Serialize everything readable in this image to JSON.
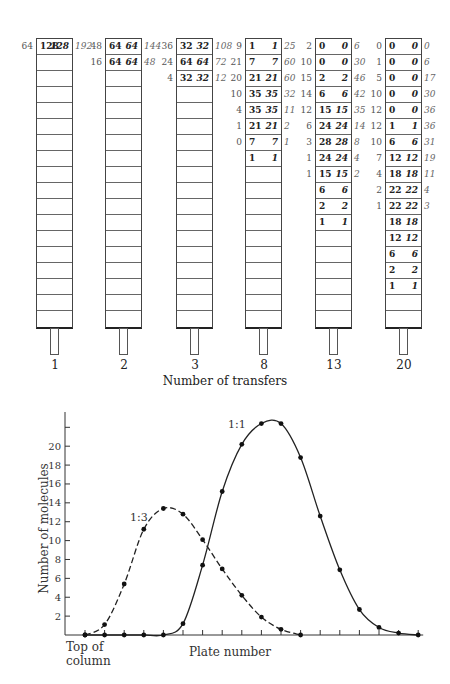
{
  "countercurrent": {
    "xlabel": "Number of transfers",
    "columns": [
      {
        "label": "1",
        "x": 36,
        "rows": [
          {
            "left": "64",
            "a": "128",
            "b": "128",
            "right": "192"
          }
        ]
      },
      {
        "label": "2",
        "x": 105,
        "rows": [
          {
            "left": "48",
            "a": "64",
            "b": "64",
            "right": "144"
          },
          {
            "left": "16",
            "a": "64",
            "b": "64",
            "right": "48"
          }
        ]
      },
      {
        "label": "3",
        "x": 176,
        "rows": [
          {
            "left": "36",
            "a": "32",
            "b": "32",
            "right": "108"
          },
          {
            "left": "24",
            "a": "64",
            "b": "64",
            "right": "72"
          },
          {
            "left": "4",
            "a": "32",
            "b": "32",
            "right": "12"
          }
        ]
      },
      {
        "label": "8",
        "x": 245,
        "rows": [
          {
            "left": "9",
            "a": "1",
            "b": "1",
            "right": "25"
          },
          {
            "left": "21",
            "a": "7",
            "b": "7",
            "right": "60"
          },
          {
            "left": "20",
            "a": "21",
            "b": "21",
            "right": "60"
          },
          {
            "left": "10",
            "a": "35",
            "b": "35",
            "right": "32"
          },
          {
            "left": "4",
            "a": "35",
            "b": "35",
            "right": "11"
          },
          {
            "left": "1",
            "a": "21",
            "b": "21",
            "right": "2"
          },
          {
            "left": "0",
            "a": "7",
            "b": "7",
            "right": "1"
          },
          {
            "left": "",
            "a": "1",
            "b": "1",
            "right": ""
          }
        ]
      },
      {
        "label": "13",
        "x": 315,
        "rows": [
          {
            "left": "2",
            "a": "0",
            "b": "0",
            "right": "6"
          },
          {
            "left": "10",
            "a": "0",
            "b": "0",
            "right": "30"
          },
          {
            "left": "15",
            "a": "2",
            "b": "2",
            "right": "46"
          },
          {
            "left": "14",
            "a": "6",
            "b": "6",
            "right": "42"
          },
          {
            "left": "12",
            "a": "15",
            "b": "15",
            "right": "35"
          },
          {
            "left": "6",
            "a": "24",
            "b": "24",
            "right": "14"
          },
          {
            "left": "3",
            "a": "28",
            "b": "28",
            "right": "8"
          },
          {
            "left": "1",
            "a": "24",
            "b": "24",
            "right": "4"
          },
          {
            "left": "1",
            "a": "15",
            "b": "15",
            "right": "2"
          },
          {
            "left": "",
            "a": "6",
            "b": "6",
            "right": ""
          },
          {
            "left": "",
            "a": "2",
            "b": "2",
            "right": ""
          },
          {
            "left": "",
            "a": "1",
            "b": "1",
            "right": ""
          }
        ]
      },
      {
        "label": "20",
        "x": 385,
        "rows": [
          {
            "left": "0",
            "a": "0",
            "b": "0",
            "right": "0"
          },
          {
            "left": "1",
            "a": "0",
            "b": "0",
            "right": "6"
          },
          {
            "left": "5",
            "a": "0",
            "b": "0",
            "right": "17"
          },
          {
            "left": "10",
            "a": "0",
            "b": "0",
            "right": "30"
          },
          {
            "left": "12",
            "a": "0",
            "b": "0",
            "right": "36"
          },
          {
            "left": "12",
            "a": "1",
            "b": "1",
            "right": "36"
          },
          {
            "left": "10",
            "a": "6",
            "b": "6",
            "right": "31"
          },
          {
            "left": "7",
            "a": "12",
            "b": "12",
            "right": "19"
          },
          {
            "left": "4",
            "a": "18",
            "b": "18",
            "right": "11"
          },
          {
            "left": "2",
            "a": "22",
            "b": "22",
            "right": "4"
          },
          {
            "left": "1",
            "a": "22",
            "b": "22",
            "right": "3"
          },
          {
            "left": "",
            "a": "18",
            "b": "18",
            "right": ""
          },
          {
            "left": "",
            "a": "12",
            "b": "12",
            "right": ""
          },
          {
            "left": "",
            "a": "6",
            "b": "6",
            "right": ""
          },
          {
            "left": "",
            "a": "2",
            "b": "2",
            "right": ""
          },
          {
            "left": "",
            "a": "1",
            "b": "1",
            "right": ""
          }
        ]
      }
    ],
    "cells_per_column": 18
  },
  "chart_data": {
    "type": "line",
    "title": "",
    "xlabel": "Plate number",
    "ylabel": "Number of molecules",
    "x_start_label": "Top of column",
    "x": [
      0,
      1,
      2,
      3,
      4,
      5,
      6,
      7,
      8,
      9,
      10,
      11,
      12,
      13,
      14,
      15,
      16,
      17
    ],
    "yticks": [
      2,
      4,
      6,
      8,
      10,
      12,
      14,
      16,
      18,
      20
    ],
    "ylim": [
      0,
      23
    ],
    "grid": false,
    "series": [
      {
        "name": "1:1",
        "style": "solid",
        "values": [
          0,
          0,
          0,
          0,
          0,
          1.2,
          7.4,
          15.2,
          20.2,
          22.4,
          22.4,
          18.8,
          12.6,
          6.9,
          2.7,
          0.8,
          0.2,
          0
        ]
      },
      {
        "name": "1:3",
        "style": "dashed",
        "values": [
          0,
          1.1,
          5.4,
          11.2,
          13.4,
          12.8,
          10.1,
          7.0,
          4.2,
          1.9,
          0.6,
          0,
          null,
          null,
          null,
          null,
          null,
          null
        ]
      }
    ]
  }
}
